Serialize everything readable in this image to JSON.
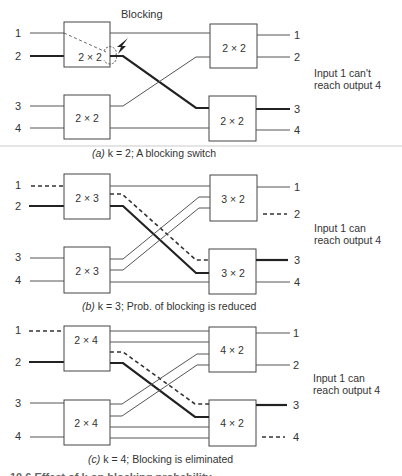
{
  "figure": {
    "panels": [
      {
        "id": "a",
        "k": 2,
        "caption_letter": "(a)",
        "caption_text": "k = 2; A blocking switch",
        "note_line1": "Input 1 can't",
        "note_line2": "reach output 4",
        "blocking_callout": "Blocking",
        "inputs": [
          "1",
          "2",
          "3",
          "4"
        ],
        "outputs": [
          "1",
          "2",
          "3",
          "4"
        ],
        "left_boxes": [
          "2 × 2",
          "2 × 2"
        ],
        "right_boxes": [
          "2 × 2",
          "2 × 2"
        ]
      },
      {
        "id": "b",
        "k": 3,
        "caption_letter": "(b)",
        "caption_text": "k = 3; Prob. of blocking is reduced",
        "note_line1": "Input 1 can",
        "note_line2": "reach output 4",
        "inputs": [
          "1",
          "2",
          "3",
          "4"
        ],
        "outputs": [
          "1",
          "2",
          "3",
          "4"
        ],
        "left_boxes": [
          "2 × 3",
          "2 × 3"
        ],
        "right_boxes": [
          "3 × 2",
          "3 × 2"
        ]
      },
      {
        "id": "c",
        "k": 4,
        "caption_letter": "(c)",
        "caption_text": "k = 4; Blocking is eliminated",
        "note_line1": "Input 1 can",
        "note_line2": "reach output 4",
        "inputs": [
          "1",
          "2",
          "3",
          "4"
        ],
        "outputs": [
          "1",
          "2",
          "3",
          "4"
        ],
        "left_boxes": [
          "2 × 4",
          "2 × 4"
        ],
        "right_boxes": [
          "4 × 2",
          "4 × 2"
        ]
      }
    ],
    "figure_caption_partial": "10.6  Effect of k on blocking probability"
  }
}
